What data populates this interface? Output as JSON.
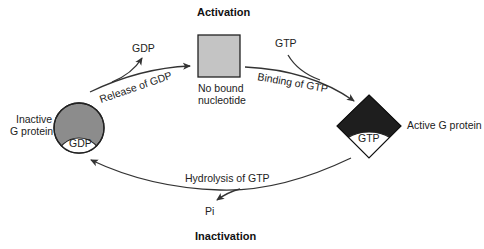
{
  "diagram": {
    "title_top": "Activation",
    "title_bottom": "Inactivation",
    "nodes": {
      "inactive": {
        "label_line1": "Inactive",
        "label_line2": "G protein",
        "inner": "GDP",
        "fill": "#8c8c8c"
      },
      "empty": {
        "label_line1": "No bound",
        "label_line2": "nucleotide",
        "fill": "#c4c4c4"
      },
      "active": {
        "label": "Active G protein",
        "inner": "GTP",
        "fill": "#1e1e1e"
      }
    },
    "edges": {
      "release": {
        "label": "Release of GDP",
        "byproduct": "GDP"
      },
      "binding": {
        "label": "Binding of GTP",
        "input": "GTP"
      },
      "hydrolysis": {
        "label": "Hydrolysis of GTP",
        "byproduct": "Pi"
      }
    }
  }
}
